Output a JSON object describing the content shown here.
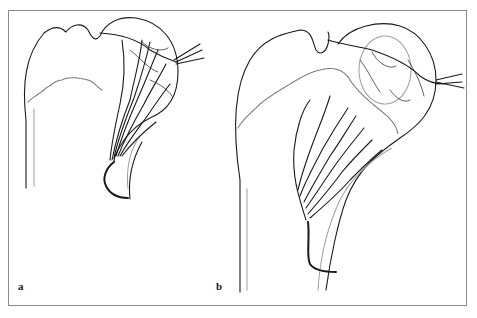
{
  "figure": {
    "panels": [
      {
        "id": "a",
        "label": "a"
      },
      {
        "id": "b",
        "label": "b"
      }
    ],
    "caption": "",
    "colors": {
      "line": "#1a1a1a",
      "dotted": "#9a9a9a",
      "frame": "#8a8a8a"
    }
  }
}
